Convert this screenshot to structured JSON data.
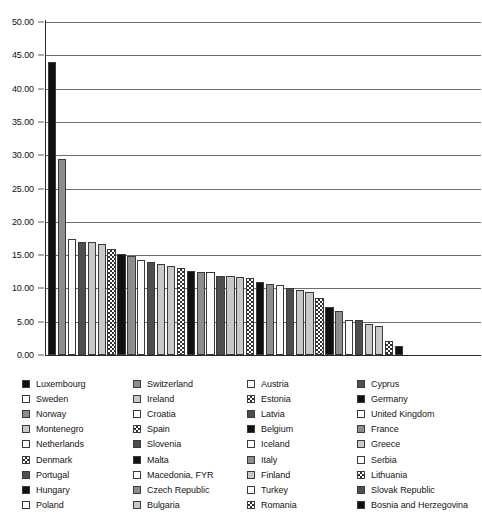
{
  "chart_data": {
    "type": "bar",
    "title": "",
    "subtitle": "",
    "xlabel": "",
    "ylabel": "",
    "ylim": [
      0,
      50
    ],
    "grid": true,
    "legend_position": "bottom",
    "legend_columns": 4,
    "y_ticks": [
      "0.00",
      "5.00",
      "10.00",
      "15.00",
      "20.00",
      "25.00",
      "30.00",
      "35.00",
      "40.00",
      "45.00",
      "50.00"
    ],
    "y_tick_values": [
      0,
      5,
      10,
      15,
      20,
      25,
      30,
      35,
      40,
      45,
      50
    ],
    "categories": [
      "Luxembourg",
      "Switzerland",
      "Austria",
      "Cyprus",
      "Sweden",
      "Ireland",
      "Estonia",
      "Germany",
      "Norway",
      "Croatia",
      "Latvia",
      "United Kingdom",
      "Montenegro",
      "Spain",
      "Belgium",
      "France",
      "Netherlands",
      "Slovenia",
      "Iceland",
      "Greece",
      "Denmark",
      "Malta",
      "Italy",
      "Serbia",
      "Portugal",
      "Macedonia, FYR",
      "Finland",
      "Lithuania",
      "Hungary",
      "Czech Republic",
      "Turkey",
      "Slovak Republic",
      "Poland",
      "Bulgaria",
      "Romania",
      "Bosnia and Herzegovina"
    ],
    "values": [
      44.0,
      29.4,
      17.4,
      17.0,
      16.9,
      16.6,
      15.9,
      15.1,
      14.9,
      14.2,
      13.9,
      13.6,
      13.4,
      13.0,
      12.6,
      12.5,
      12.4,
      11.9,
      11.8,
      11.7,
      11.6,
      10.9,
      10.7,
      10.5,
      10.0,
      9.7,
      9.5,
      8.6,
      7.2,
      6.6,
      5.3,
      5.2,
      4.6,
      4.4,
      2.1,
      1.3
    ],
    "fills": [
      "black",
      "mdgray",
      "white",
      "dkgray",
      "ltgray",
      "ltgray",
      "check",
      "black",
      "mdgray",
      "white",
      "dkgray",
      "ltgray",
      "ltgray",
      "check",
      "black",
      "mdgray",
      "white",
      "dkgray",
      "ltgray",
      "ltgray",
      "check",
      "black",
      "mdgray",
      "white",
      "dkgray",
      "ltgray",
      "ltgray",
      "check",
      "black",
      "mdgray",
      "white",
      "dkgray",
      "ltgray",
      "ltgray",
      "check",
      "black"
    ]
  },
  "legend": {
    "columns": [
      {
        "items": [
          {
            "label": "Luxembourg",
            "fill": "black"
          },
          {
            "label": "Sweden",
            "fill": "white"
          },
          {
            "label": "Norway",
            "fill": "mdgray"
          },
          {
            "label": "Montenegro",
            "fill": "ltgray"
          },
          {
            "label": "Netherlands",
            "fill": "white"
          },
          {
            "label": "Denmark",
            "fill": "check"
          },
          {
            "label": "Portugal",
            "fill": "dkgray"
          },
          {
            "label": "Hungary",
            "fill": "black"
          },
          {
            "label": "Poland",
            "fill": "white"
          }
        ]
      },
      {
        "items": [
          {
            "label": "Switzerland",
            "fill": "mdgray"
          },
          {
            "label": "Ireland",
            "fill": "ltgray"
          },
          {
            "label": "Croatia",
            "fill": "white"
          },
          {
            "label": "Spain",
            "fill": "check"
          },
          {
            "label": "Slovenia",
            "fill": "dkgray"
          },
          {
            "label": "Malta",
            "fill": "black"
          },
          {
            "label": "Macedonia, FYR",
            "fill": "white"
          },
          {
            "label": "Czech Republic",
            "fill": "mdgray"
          },
          {
            "label": "Bulgaria",
            "fill": "ltgray"
          }
        ]
      },
      {
        "items": [
          {
            "label": "Austria",
            "fill": "white"
          },
          {
            "label": "Estonia",
            "fill": "check"
          },
          {
            "label": "Latvia",
            "fill": "dkgray"
          },
          {
            "label": "Belgium",
            "fill": "black"
          },
          {
            "label": "Iceland",
            "fill": "white"
          },
          {
            "label": "Italy",
            "fill": "mdgray"
          },
          {
            "label": "Finland",
            "fill": "ltgray"
          },
          {
            "label": "Turkey",
            "fill": "white"
          },
          {
            "label": "Romania",
            "fill": "check"
          }
        ]
      },
      {
        "items": [
          {
            "label": "Cyprus",
            "fill": "dkgray"
          },
          {
            "label": "Germany",
            "fill": "black"
          },
          {
            "label": "United Kingdom",
            "fill": "white"
          },
          {
            "label": "France",
            "fill": "mdgray"
          },
          {
            "label": "Greece",
            "fill": "ltgray"
          },
          {
            "label": "Serbia",
            "fill": "white"
          },
          {
            "label": "Lithuania",
            "fill": "check"
          },
          {
            "label": "Slovak Republic",
            "fill": "dkgray"
          },
          {
            "label": "Bosnia and Herzegovina",
            "fill": "black"
          }
        ]
      }
    ]
  }
}
